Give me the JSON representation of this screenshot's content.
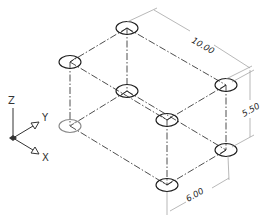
{
  "drawing": {
    "type": "isometric wireframe box with hole markers",
    "dimensions": {
      "length": {
        "label": "10.00",
        "value": 10.0
      },
      "height": {
        "label": "5.50",
        "value": 5.5
      },
      "width": {
        "label": "6.00",
        "value": 6.0
      }
    },
    "ucs_icon": {
      "z_label": "Z",
      "y_label": "Y",
      "x_label": "X"
    },
    "vertices": [
      {
        "name": "top-back-left",
        "x": 127,
        "y": 28
      },
      {
        "name": "top-left",
        "x": 70,
        "y": 62
      },
      {
        "name": "top-right",
        "x": 226,
        "y": 85
      },
      {
        "name": "top-front",
        "x": 167,
        "y": 120
      },
      {
        "name": "bottom-back",
        "x": 127,
        "y": 91
      },
      {
        "name": "bottom-left",
        "x": 70,
        "y": 126
      },
      {
        "name": "bottom-right",
        "x": 226,
        "y": 150
      },
      {
        "name": "bottom-front",
        "x": 167,
        "y": 185
      }
    ],
    "colors": {
      "line": "#3a3a3a",
      "ellipse": "#1e1e1e",
      "dimension": "#9a9a9a",
      "background": "#ffffff"
    }
  }
}
